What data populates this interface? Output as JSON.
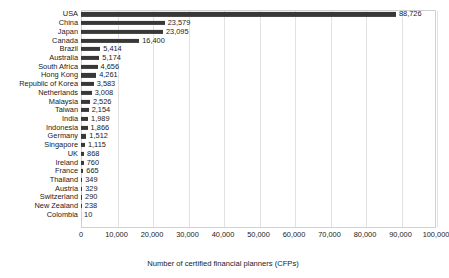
{
  "chart_data": {
    "type": "bar",
    "orientation": "horizontal",
    "title": "",
    "xlabel": "Number of certified financial planners (CFPs)",
    "ylabel": "",
    "xlim": [
      0,
      100000
    ],
    "xticks": [
      "0",
      "10,000",
      "20,000",
      "30,000",
      "40,000",
      "50,000",
      "60,000",
      "70,000",
      "80,000",
      "90,000",
      "100,000"
    ],
    "xtick_values": [
      0,
      10000,
      20000,
      30000,
      40000,
      50000,
      60000,
      70000,
      80000,
      90000,
      100000
    ],
    "grid": true,
    "legend": false,
    "bar_color": "#383838",
    "categories": [
      "USA",
      "China",
      "Japan",
      "Canada",
      "Brazil",
      "Australia",
      "South Africa",
      "Hong Kong",
      "Republic of Korea",
      "Netherlands",
      "Malaysia",
      "Taiwan",
      "India",
      "Indonesia",
      "Germany",
      "Singapore",
      "UK",
      "Ireland",
      "France",
      "Thailand",
      "Austria",
      "Switzerland",
      "New Zealand",
      "Colombia"
    ],
    "values": [
      88726,
      23579,
      23095,
      16400,
      5414,
      5174,
      4656,
      4261,
      3583,
      3008,
      2526,
      2154,
      1989,
      1866,
      1512,
      1115,
      868,
      760,
      665,
      349,
      329,
      290,
      238,
      10
    ],
    "data_labels": [
      "88,726",
      "23,579",
      "23,095",
      "16,400",
      "5,414",
      "5,174",
      "4,656",
      "4,261",
      "3,583",
      "3,008",
      "2,526",
      "2,154",
      "1,989",
      "1,866",
      "1,512",
      "1,115",
      "868",
      "760",
      "665",
      "349",
      "329",
      "290",
      "238",
      "10"
    ]
  }
}
